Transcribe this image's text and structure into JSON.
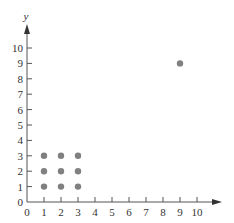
{
  "chart_data": {
    "type": "scatter",
    "title": "",
    "xlabel": "",
    "ylabel": "y",
    "xlim": [
      0,
      10
    ],
    "ylim": [
      0,
      10
    ],
    "grid": false,
    "x_ticks": [
      "0",
      "1",
      "2",
      "3",
      "4",
      "5",
      "6",
      "7",
      "8",
      "9",
      "10"
    ],
    "y_ticks": [
      "0",
      "1",
      "2",
      "3",
      "4",
      "5",
      "6",
      "7",
      "8",
      "9",
      "10"
    ],
    "series": [
      {
        "name": "points",
        "color": "#808080",
        "points": [
          [
            1,
            1
          ],
          [
            2,
            1
          ],
          [
            3,
            1
          ],
          [
            1,
            2
          ],
          [
            2,
            2
          ],
          [
            3,
            2
          ],
          [
            1,
            3
          ],
          [
            2,
            3
          ],
          [
            3,
            3
          ],
          [
            9,
            9
          ]
        ]
      }
    ]
  }
}
